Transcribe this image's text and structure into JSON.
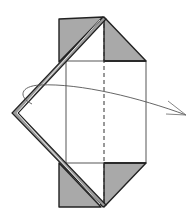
{
  "diagram": {
    "type": "origami-step",
    "colors": {
      "paper_back": "#a9a9a9",
      "paper_front": "#ffffff",
      "outline": "#222222",
      "fold_line": "#333333",
      "arrow": "#555555",
      "double_edge_fill": "#9a9a9a"
    },
    "elements": [
      {
        "name": "top-left-flap",
        "kind": "shaded-triangle"
      },
      {
        "name": "top-right-flap",
        "kind": "shaded-triangle"
      },
      {
        "name": "bottom-left-flap",
        "kind": "shaded-triangle"
      },
      {
        "name": "bottom-right-flap",
        "kind": "shaded-triangle"
      },
      {
        "name": "center-panel",
        "kind": "white-rectangle"
      },
      {
        "name": "center-valley-fold",
        "kind": "dashed-line"
      },
      {
        "name": "left-point-edge",
        "kind": "double-edge"
      },
      {
        "name": "turn-over-arrow",
        "kind": "curved-arrow"
      }
    ]
  }
}
